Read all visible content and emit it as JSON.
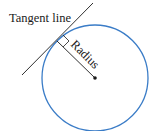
{
  "diagram": {
    "labels": {
      "tangent": "Tangent line",
      "radius": "Radius"
    },
    "colors": {
      "circle": "#3a7cc7",
      "line": "#1a1a1a"
    },
    "circle": {
      "cx": 95,
      "cy": 78,
      "r": 53
    },
    "tangent_point": {
      "x": 57,
      "y": 41
    }
  }
}
